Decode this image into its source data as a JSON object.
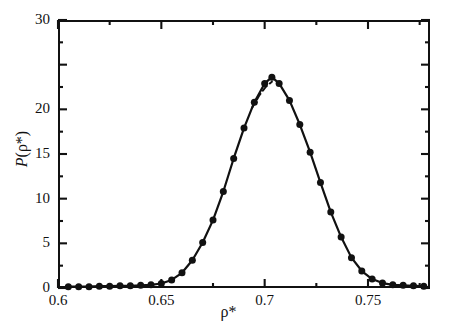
{
  "figure": {
    "background": "#ffffff",
    "ink_color": "#111111"
  },
  "axes": {
    "x_title": "ρ*",
    "y_title_prefix": "P",
    "y_title_suffix": "(ρ*)",
    "x_tick_labels": [
      "0.6",
      "0.65",
      "0.7",
      "0.75"
    ],
    "y_tick_labels": [
      "0",
      "5",
      "10",
      "15",
      "20",
      "30"
    ]
  },
  "chart_data": {
    "type": "line",
    "title": "",
    "xlabel": "ρ*",
    "ylabel": "P(ρ*)",
    "xlim": [
      0.6,
      0.78
    ],
    "ylim": [
      0,
      30
    ],
    "xticks": [
      0.6,
      0.65,
      0.7,
      0.75
    ],
    "xticks_minor": [
      0.625,
      0.675,
      0.725,
      0.775
    ],
    "yticks": [
      0,
      5,
      10,
      15,
      20,
      25,
      30
    ],
    "ytick_labels_shown": [
      "0",
      "5",
      "10",
      "15",
      "20",
      "",
      "30"
    ],
    "yticks_minor": [
      2.5,
      7.5,
      12.5,
      17.5,
      22.5,
      27.5
    ],
    "grid": false,
    "legend": "none",
    "marker": "filled-circle",
    "series": [
      {
        "name": "simulation",
        "style": "solid-line-with-markers",
        "x": [
          0.605,
          0.61,
          0.615,
          0.62,
          0.625,
          0.63,
          0.635,
          0.64,
          0.645,
          0.65,
          0.655,
          0.66,
          0.665,
          0.67,
          0.675,
          0.68,
          0.685,
          0.69,
          0.695,
          0.7,
          0.7035,
          0.707,
          0.712,
          0.717,
          0.722,
          0.727,
          0.732,
          0.737,
          0.742,
          0.747,
          0.752,
          0.757,
          0.762,
          0.767,
          0.772,
          0.777
        ],
        "y": [
          0.15,
          0.15,
          0.15,
          0.2,
          0.2,
          0.25,
          0.25,
          0.3,
          0.35,
          0.5,
          0.9,
          1.7,
          3.1,
          5.1,
          7.6,
          10.8,
          14.5,
          17.9,
          20.8,
          22.9,
          23.6,
          22.9,
          21.0,
          18.3,
          15.2,
          11.8,
          8.5,
          5.7,
          3.4,
          1.9,
          1.0,
          0.55,
          0.35,
          0.3,
          0.25,
          0.2
        ]
      },
      {
        "name": "fit",
        "style": "dashed-line",
        "x": [
          0.694,
          0.6975,
          0.7005,
          0.7035
        ],
        "y": [
          20.2,
          21.6,
          22.5,
          23.1
        ]
      }
    ]
  }
}
